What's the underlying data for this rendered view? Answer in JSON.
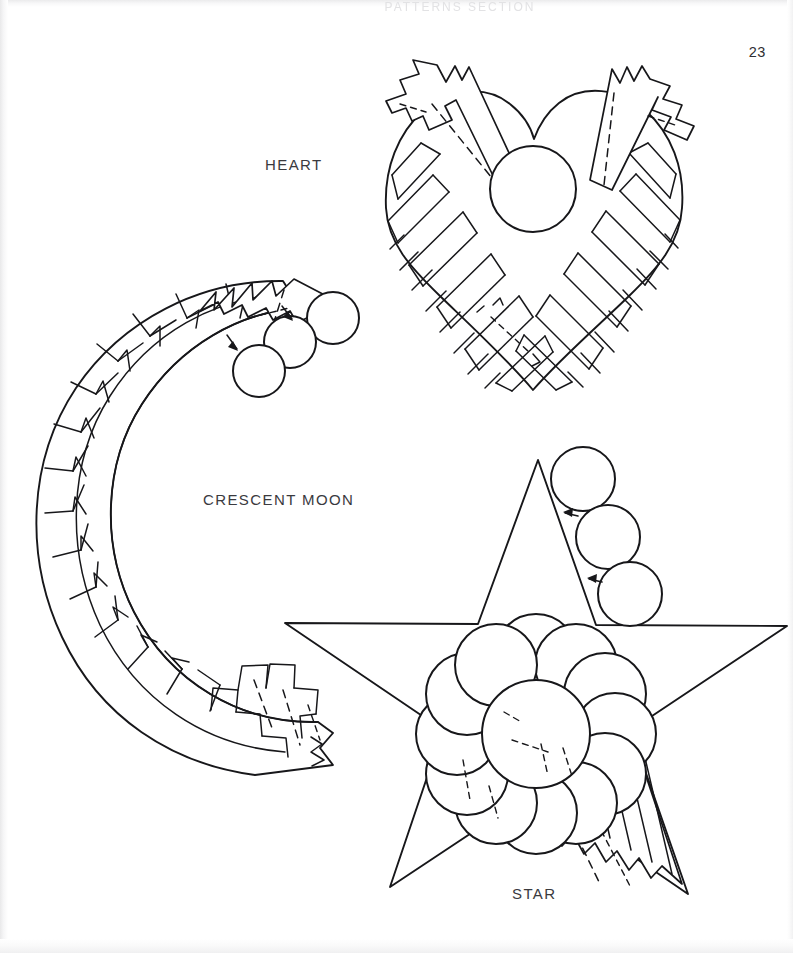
{
  "page": {
    "number": "23",
    "ghost_text": "PATTERNS   SECTION",
    "ink_color": "#17171a",
    "text_color": "#3a3a3e",
    "background_color": "#ffffff"
  },
  "figures": [
    {
      "id": "heart",
      "label": "HEART",
      "shape": "heart",
      "description": "Folded ribbon strip heart pattern with center circle and two crossing ribbon bands",
      "center_circles": 1,
      "guide_circles": 0,
      "arrows": 0
    },
    {
      "id": "crescent-moon",
      "label": "CRESCENT MOON",
      "shape": "crescent",
      "description": "Folded ribbon strip crescent moon pattern with three assembly guide circles and direction arrows",
      "center_circles": 0,
      "guide_circles": 3,
      "arrows": 2
    },
    {
      "id": "star",
      "label": "STAR",
      "shape": "five-point-star",
      "description": "Five point star with overlapping circle rosette center, folded ribbon tail, three assembly guide circles and direction arrows",
      "center_circles": 1,
      "guide_circles": 3,
      "arrows": 2
    }
  ]
}
